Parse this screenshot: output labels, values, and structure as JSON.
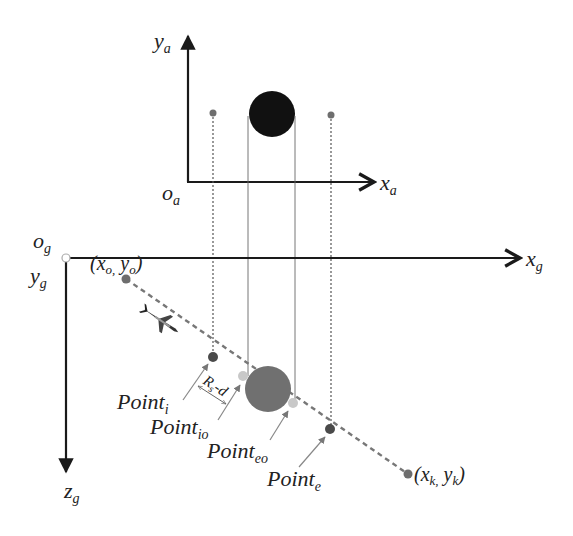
{
  "colors": {
    "axis": "#1a1a1a",
    "obstacle_air": "#111111",
    "obstacle_ground": "#707070",
    "trajectory_point": "#6e6e6e",
    "intersection_point": "#c8c8c8",
    "guide_line": "#555555",
    "pointer_arrow": "#777777"
  },
  "air_frame": {
    "origin_label": {
      "base": "o",
      "sub": "a"
    },
    "x_axis_label": {
      "base": "x",
      "sub": "a"
    },
    "y_axis_label": {
      "base": "y",
      "sub": "a"
    }
  },
  "ground_frame": {
    "origin_label": {
      "base": "o",
      "sub": "g"
    },
    "x_axis_label": {
      "base": "x",
      "sub": "g"
    },
    "y_axis_label": {
      "base": "y",
      "sub": "g"
    },
    "z_axis_label": {
      "base": "z",
      "sub": "g"
    }
  },
  "trajectory": {
    "start_label": {
      "open": "(",
      "x": "x",
      "xs": "o,",
      "y": " y",
      "ys": "o",
      "close": ")"
    },
    "end_label": {
      "open": "(",
      "x": "x",
      "xs": "k,",
      "y": " y",
      "ys": "k",
      "close": ")"
    }
  },
  "points": [
    {
      "id": "point-i",
      "base": "Point",
      "sub": "i"
    },
    {
      "id": "point-io",
      "base": "Point",
      "sub": "io"
    },
    {
      "id": "point-eo",
      "base": "Point",
      "sub": "eo"
    },
    {
      "id": "point-e",
      "base": "Point",
      "sub": "e"
    }
  ],
  "dimension_label": {
    "base": "R",
    "sub": "s",
    "rest": "-d"
  }
}
